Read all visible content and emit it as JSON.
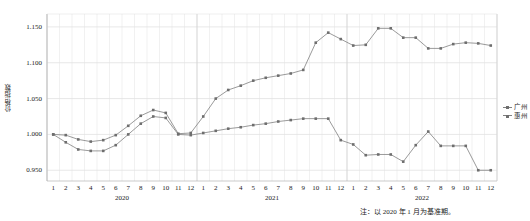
{
  "chart_data": {
    "type": "line",
    "title": "",
    "xlabel": "",
    "ylabel": "价格指数",
    "ylim": [
      0.935,
      1.168
    ],
    "yticks": [
      0.95,
      1.0,
      1.05,
      1.1,
      1.15
    ],
    "ytick_labels": [
      "0.950",
      "1.000",
      "1.050",
      "1.100",
      "1.150"
    ],
    "grid": true,
    "legend_position": "right",
    "years": [
      {
        "label": "2020",
        "months": [
          "1",
          "2",
          "3",
          "4",
          "5",
          "6",
          "7",
          "8",
          "9",
          "10",
          "11",
          "12"
        ]
      },
      {
        "label": "2021",
        "months": [
          "1",
          "2",
          "3",
          "4",
          "5",
          "6",
          "7",
          "8",
          "9",
          "10",
          "11",
          "12"
        ]
      },
      {
        "label": "2022",
        "months": [
          "1",
          "2",
          "3",
          "4",
          "5",
          "6",
          "7",
          "8",
          "9",
          "10",
          "11",
          "12"
        ]
      }
    ],
    "x": [
      "2020-1",
      "2020-2",
      "2020-3",
      "2020-4",
      "2020-5",
      "2020-6",
      "2020-7",
      "2020-8",
      "2020-9",
      "2020-10",
      "2020-11",
      "2020-12",
      "2021-1",
      "2021-2",
      "2021-3",
      "2021-4",
      "2021-5",
      "2021-6",
      "2021-7",
      "2021-8",
      "2021-9",
      "2021-10",
      "2021-11",
      "2021-12",
      "2022-1",
      "2022-2",
      "2022-3",
      "2022-4",
      "2022-5",
      "2022-6",
      "2022-7",
      "2022-8",
      "2022-9",
      "2022-10",
      "2022-11",
      "2022-12"
    ],
    "series": [
      {
        "name": "广州",
        "color": "#808080",
        "values": [
          1.0,
          0.999,
          0.993,
          0.99,
          0.992,
          0.999,
          1.012,
          1.026,
          1.034,
          1.03,
          1.001,
          1.002,
          1.025,
          1.05,
          1.062,
          1.068,
          1.075,
          1.079,
          1.082,
          1.085,
          1.09,
          1.128,
          1.142,
          1.133,
          1.124,
          1.125,
          1.148,
          1.148,
          1.135,
          1.135,
          1.12,
          1.12,
          1.126,
          1.128,
          1.127,
          1.124
        ]
      },
      {
        "name": "惠州",
        "color": "#808080",
        "values": [
          1.0,
          0.989,
          0.979,
          0.977,
          0.977,
          0.985,
          1.0,
          1.015,
          1.025,
          1.023,
          1.0,
          0.999,
          1.002,
          1.005,
          1.008,
          1.01,
          1.013,
          1.015,
          1.018,
          1.02,
          1.022,
          1.022,
          1.022,
          0.992,
          0.986,
          0.971,
          0.972,
          0.972,
          0.962,
          0.985,
          1.004,
          0.984,
          0.984,
          0.984,
          0.95,
          0.95
        ]
      }
    ],
    "note": "注：以 2020 年 1 月为基准期。"
  }
}
